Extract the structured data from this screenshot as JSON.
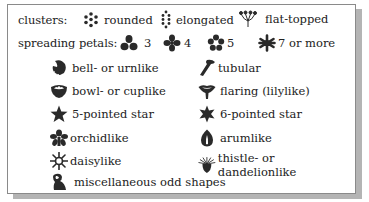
{
  "clusters": {
    "label": "clusters:",
    "items": [
      {
        "icon": "rounded-cluster-icon",
        "label": "rounded"
      },
      {
        "icon": "elongated-cluster-icon",
        "label": "elongated"
      },
      {
        "icon": "flat-topped-cluster-icon",
        "label": "flat-topped"
      }
    ]
  },
  "spreading_petals": {
    "label": "spreading petals:",
    "items": [
      {
        "icon": "three-petal-icon",
        "label": "3"
      },
      {
        "icon": "four-petal-icon",
        "label": "4"
      },
      {
        "icon": "five-petal-icon",
        "label": "5"
      },
      {
        "icon": "seven-petal-icon",
        "label": "7 or more"
      }
    ]
  },
  "shapes": {
    "left": [
      {
        "icon": "bell-icon",
        "label": "bell- or urnlike"
      },
      {
        "icon": "bowl-icon",
        "label": "bowl- or cuplike"
      },
      {
        "icon": "five-pointed-star-icon",
        "label": "5-pointed star"
      },
      {
        "icon": "orchid-icon",
        "label": "orchidlike"
      },
      {
        "icon": "daisy-icon",
        "label": "daisylike"
      },
      {
        "icon": "odd-shape-icon",
        "label": "miscellaneous odd shapes"
      }
    ],
    "right": [
      {
        "icon": "tubular-icon",
        "label": "tubular"
      },
      {
        "icon": "flaring-icon",
        "label": "flaring (lilylike)"
      },
      {
        "icon": "six-pointed-star-icon",
        "label": "6-pointed star"
      },
      {
        "icon": "arum-icon",
        "label": "arumlike"
      },
      {
        "icon": "thistle-icon",
        "label": "thistle- or dandelionlike"
      }
    ]
  },
  "colors": {
    "icon_fill": "#2a2a2a",
    "border": "#8a8a8a",
    "shadow": "#b4b4b4"
  }
}
